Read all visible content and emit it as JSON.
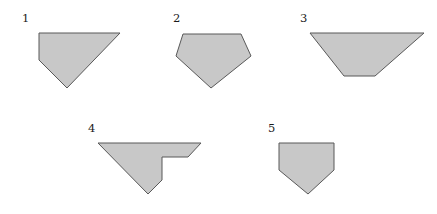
{
  "figure": {
    "background_color": "#ffffff",
    "fill_color": "#c8c8c8",
    "stroke_color": "#595959",
    "stroke_width": 1,
    "width": 437,
    "height": 214,
    "shapes": [
      {
        "label": "1",
        "name": "shape-1-quadrilateral",
        "description": "right trapezoid / quadrilateral with vertical left edge, horizontal top edge, long slanted right edge and slanted bottom-left edge",
        "vertex_count": 4,
        "points": "39,33 120,33 67,88 39,60",
        "label_x": 22,
        "label_y": 22
      },
      {
        "label": "2",
        "name": "shape-2-pentagon",
        "description": "pentagon, kite-like, with flat top edge, two short upper side edges and two long lower edges meeting at a bottom point",
        "vertex_count": 5,
        "points": "183,34 241,34 251,56 211,88 176,56",
        "label_x": 173,
        "label_y": 22
      },
      {
        "label": "3",
        "name": "shape-3-trapezoid",
        "description": "inverted isosceles trapezoid, wide horizontal top edge and narrow horizontal bottom edge",
        "vertex_count": 4,
        "points": "310,33 424,33 375,76 344,76",
        "label_x": 300,
        "label_y": 22
      },
      {
        "label": "4",
        "name": "shape-4-concave-polygon",
        "description": "concave hexagon with a rectangular notch cut from the lower right, arrow-like / flag-like outline",
        "vertex_count": 6,
        "points": "98,143 201,143 188,157 162,157 162,180 148,194",
        "label_x": 88,
        "label_y": 132
      },
      {
        "label": "5",
        "name": "shape-5-home-plate-pentagon",
        "description": "home-plate pentagon, rectangular top with a downward point at the bottom",
        "vertex_count": 5,
        "points": "279,143 334,143 334,170 308,194 279,170",
        "label_x": 268,
        "label_y": 132
      }
    ]
  }
}
